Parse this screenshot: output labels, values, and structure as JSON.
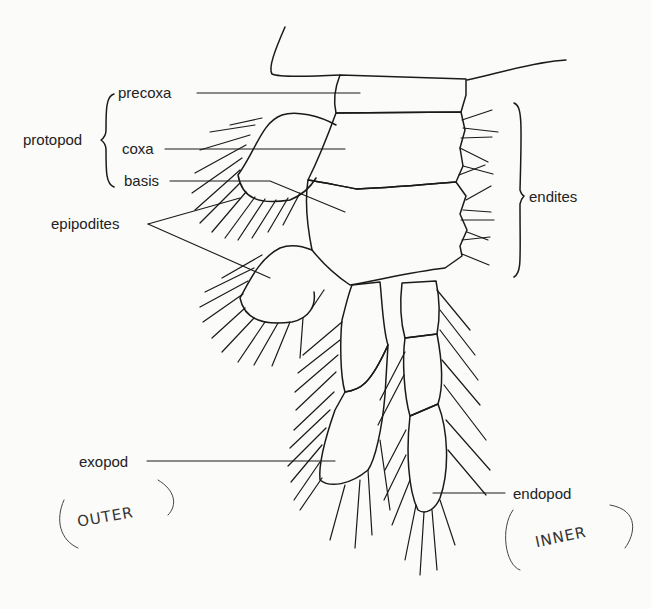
{
  "diagram": {
    "labels": {
      "precoxa": "precoxa",
      "coxa": "coxa",
      "basis": "basis",
      "protopod": "protopod",
      "epipodites": "epipodites",
      "endites": "endites",
      "exopod": "exopod",
      "endopod": "endopod"
    },
    "annotations": {
      "outer": "OUTER",
      "inner": "INNER"
    },
    "colors": {
      "ink": "#1a1a1a",
      "paper": "#fbfbf9",
      "pencil": "#333333"
    }
  }
}
